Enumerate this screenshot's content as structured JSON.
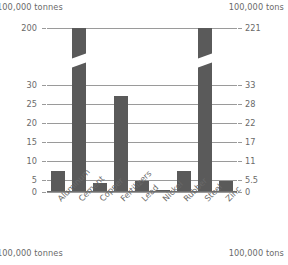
{
  "header": {
    "left_units": "100,000 tonnes",
    "right_units": "100,000 tons"
  },
  "footer": {
    "left_units": "100,000 tonnes",
    "right_units": "100,000 tons"
  },
  "colors": {
    "bar": "#5a5a5a",
    "gridline": "#9a9a9a",
    "axis": "#6f6f6f",
    "text": "#6a6a6a",
    "background": "#ffffff"
  },
  "chart_data": {
    "type": "bar",
    "title": "",
    "xlabel": "",
    "ylabel": "100,000 tonnes",
    "y2label": "100,000 tons",
    "grid": true,
    "legend": false,
    "broken_axis": true,
    "categories": [
      "Aluminum",
      "Cement",
      "Copper",
      "Fertilizers",
      "Lead",
      "Nickel",
      "Rubber",
      "Steel",
      "Zinc"
    ],
    "values": [
      6,
      200,
      2.5,
      27,
      3,
      0.3,
      6,
      196,
      3
    ],
    "ylim": [
      0,
      200
    ],
    "yticks_left": [
      "200",
      "30",
      "25",
      "20",
      "15",
      "10",
      "5",
      "0"
    ],
    "yticks_right": [
      "221",
      "33",
      "28",
      "22",
      "17",
      "11",
      "5.5",
      "0"
    ],
    "tick_positions": [
      0,
      57,
      76,
      95,
      114,
      133,
      152,
      164
    ],
    "bars": [
      {
        "category": "Aluminum",
        "value": 6,
        "broken": false
      },
      {
        "category": "Cement",
        "value": 200,
        "broken": true
      },
      {
        "category": "Copper",
        "value": 2.5,
        "broken": false
      },
      {
        "category": "Fertilizers",
        "value": 27,
        "broken": false
      },
      {
        "category": "Lead",
        "value": 3,
        "broken": false
      },
      {
        "category": "Nickel",
        "value": 0.3,
        "broken": false
      },
      {
        "category": "Rubber",
        "value": 6,
        "broken": false
      },
      {
        "category": "Steel",
        "value": 196,
        "broken": true
      },
      {
        "category": "Zinc",
        "value": 3,
        "broken": false
      }
    ]
  }
}
